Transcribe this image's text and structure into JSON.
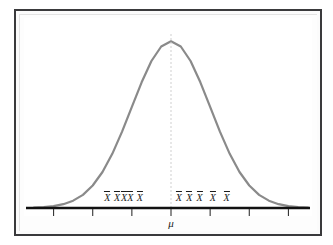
{
  "figure": {
    "kind": "normal-distribution-sampling-diagram",
    "background_color": "#ffffff",
    "frame_color": "#3a3a3c",
    "mat_color": "#fdfdfd"
  },
  "chart_data": {
    "type": "line",
    "title": "",
    "subtitle": "",
    "xlabel": "",
    "ylabel": "",
    "grid": false,
    "legend": null,
    "curve": {
      "name": "normal-density",
      "color": "#8a8a8a",
      "line_width": 2.2,
      "mean": 0,
      "sd": 1,
      "xlim": [
        -3.5,
        3.5
      ],
      "ylim": [
        0,
        1.05
      ],
      "x": [
        -3.5,
        -3.25,
        -3,
        -2.75,
        -2.5,
        -2.25,
        -2,
        -1.75,
        -1.5,
        -1.25,
        -1,
        -0.75,
        -0.5,
        -0.25,
        0,
        0.25,
        0.5,
        0.75,
        1,
        1.25,
        1.5,
        1.75,
        2,
        2.25,
        2.5,
        2.75,
        3,
        3.25,
        3.5
      ],
      "y": [
        0.002,
        0.005,
        0.011,
        0.023,
        0.044,
        0.079,
        0.135,
        0.216,
        0.325,
        0.458,
        0.607,
        0.754,
        0.882,
        0.969,
        1.0,
        0.969,
        0.882,
        0.754,
        0.607,
        0.458,
        0.325,
        0.216,
        0.135,
        0.079,
        0.044,
        0.023,
        0.011,
        0.005,
        0.002
      ]
    },
    "center_line": {
      "name": "mean-reference-line",
      "value": 0,
      "style": "dashed",
      "color": "#cfcfcf"
    },
    "axis": {
      "color": "#111111",
      "line_width": 2.4,
      "tick_color": "#333333",
      "tick_values": [
        -3.0,
        -2.0,
        -1.0,
        0.0,
        1.0,
        2.0,
        3.0
      ],
      "tick_labels": [
        "",
        "",
        "",
        "",
        "",
        "",
        ""
      ]
    },
    "annotations": {
      "mean_symbol": "μ",
      "mean_symbol_x": 0.0,
      "sample_mean_symbol": "X",
      "sample_mean_points": [
        {
          "label": "X",
          "x": -1.63
        },
        {
          "label": "X",
          "x": -1.38
        },
        {
          "label": "X",
          "x": -1.2
        },
        {
          "label": "X",
          "x": -1.04
        },
        {
          "label": "X",
          "x": -0.8
        },
        {
          "label": "X",
          "x": 0.2
        },
        {
          "label": "X",
          "x": 0.47
        },
        {
          "label": "X",
          "x": 0.73
        },
        {
          "label": "X",
          "x": 1.07
        },
        {
          "label": "X",
          "x": 1.42
        }
      ]
    }
  }
}
